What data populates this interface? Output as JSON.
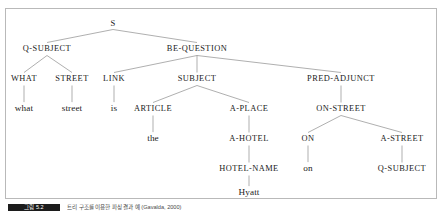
{
  "figure": {
    "kind": "syntax-parse-tree",
    "sentence": "what street is the Hyatt on",
    "line_color": "#8c8c8c",
    "text_color": "#1a1a1a",
    "frame_color": "#b9b9b9",
    "background": "#ffffff"
  },
  "caption": {
    "tag_label": "그림 5.2",
    "text": "트리 구조를 이용한 파싱 결과 예 (Gavalda, 2000)"
  },
  "nodes": {
    "root": {
      "label": "S",
      "x": 107,
      "y": 14
    },
    "q_subject": {
      "label": "Q-SUBJECT",
      "x": 41,
      "y": 40
    },
    "be_question": {
      "label": "BE-QUESTION",
      "x": 191,
      "y": 40
    },
    "what": {
      "label": "WHAT",
      "x": 18,
      "y": 70
    },
    "street_cat": {
      "label": "STREET",
      "x": 66,
      "y": 70
    },
    "link": {
      "label": "LINK",
      "x": 108,
      "y": 70
    },
    "subject": {
      "label": "SUBJECT",
      "x": 191,
      "y": 70
    },
    "pred_adjunct": {
      "label": "PRED-ADJUNCT",
      "x": 335,
      "y": 70
    },
    "w_what": {
      "label": "what",
      "x": 18,
      "y": 100
    },
    "w_street": {
      "label": "street",
      "x": 66,
      "y": 100
    },
    "w_is": {
      "label": "is",
      "x": 108,
      "y": 100
    },
    "article": {
      "label": "ARTICLE",
      "x": 147,
      "y": 100
    },
    "a_place": {
      "label": "A-PLACE",
      "x": 243,
      "y": 100
    },
    "on_street": {
      "label": "ON-STREET",
      "x": 335,
      "y": 100
    },
    "w_the": {
      "label": "the",
      "x": 147,
      "y": 130
    },
    "a_hotel": {
      "label": "A-HOTEL",
      "x": 243,
      "y": 130
    },
    "on_cat": {
      "label": "ON",
      "x": 302,
      "y": 130
    },
    "a_street": {
      "label": "A-STREET",
      "x": 396,
      "y": 130
    },
    "hotel_name": {
      "label": "HOTEL-NAME",
      "x": 243,
      "y": 160
    },
    "w_on": {
      "label": "on",
      "x": 302,
      "y": 160
    },
    "q_subject2": {
      "label": "Q-SUBJECT",
      "x": 396,
      "y": 160
    },
    "w_hyatt": {
      "label": "Hyatt",
      "x": 243,
      "y": 184
    }
  },
  "edges": [
    {
      "from": "root",
      "to": "q_subject"
    },
    {
      "from": "root",
      "to": "be_question"
    },
    {
      "from": "q_subject",
      "to": "what"
    },
    {
      "from": "q_subject",
      "to": "street_cat"
    },
    {
      "from": "be_question",
      "to": "link"
    },
    {
      "from": "be_question",
      "to": "subject"
    },
    {
      "from": "be_question",
      "to": "pred_adjunct"
    },
    {
      "from": "what",
      "to": "w_what"
    },
    {
      "from": "street_cat",
      "to": "w_street"
    },
    {
      "from": "link",
      "to": "w_is"
    },
    {
      "from": "subject",
      "to": "article"
    },
    {
      "from": "subject",
      "to": "a_place"
    },
    {
      "from": "pred_adjunct",
      "to": "on_street"
    },
    {
      "from": "article",
      "to": "w_the"
    },
    {
      "from": "a_place",
      "to": "a_hotel"
    },
    {
      "from": "on_street",
      "to": "on_cat"
    },
    {
      "from": "on_street",
      "to": "a_street"
    },
    {
      "from": "a_hotel",
      "to": "hotel_name"
    },
    {
      "from": "on_cat",
      "to": "w_on"
    },
    {
      "from": "a_street",
      "to": "q_subject2"
    },
    {
      "from": "hotel_name",
      "to": "w_hyatt"
    }
  ]
}
